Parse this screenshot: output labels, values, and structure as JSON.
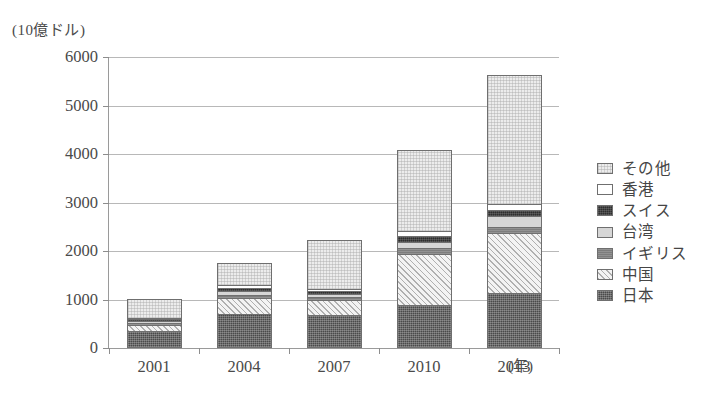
{
  "chart_data": {
    "type": "bar",
    "title": "",
    "ylabel": "(10億ドル)",
    "xlabel": "(年)",
    "ylim": [
      0,
      6000
    ],
    "yticks": [
      0,
      1000,
      2000,
      3000,
      4000,
      5000,
      6000
    ],
    "ytick_labels": [
      "0",
      "1000",
      "2000",
      "3000",
      "4000",
      "5000",
      "6000"
    ],
    "grid": true,
    "stacked": true,
    "legend_position": "right",
    "categories": [
      "2001",
      "2004",
      "2007",
      "2010",
      "2013"
    ],
    "series": [
      {
        "name": "日本",
        "key": "japan",
        "values": [
          360,
          700,
          680,
          880,
          1140
        ]
      },
      {
        "name": "中国",
        "key": "china",
        "values": [
          110,
          330,
          310,
          1060,
          1230
        ]
      },
      {
        "name": "イギリス",
        "key": "uk",
        "values": [
          40,
          70,
          60,
          130,
          130
        ]
      },
      {
        "name": "台湾",
        "key": "taiwan",
        "values": [
          40,
          70,
          60,
          110,
          220
        ]
      },
      {
        "name": "スイス",
        "key": "swiss",
        "values": [
          40,
          70,
          60,
          120,
          130
        ]
      },
      {
        "name": "香港",
        "key": "hk",
        "values": [
          30,
          60,
          50,
          110,
          120
        ]
      },
      {
        "name": "その他",
        "key": "other",
        "values": [
          400,
          460,
          1000,
          1670,
          2660
        ]
      }
    ],
    "totals": [
      1020,
      1760,
      2220,
      4080,
      5630
    ]
  },
  "legend": {
    "items": [
      {
        "label": "その他",
        "key": "other"
      },
      {
        "label": "香港",
        "key": "hk"
      },
      {
        "label": "スイス",
        "key": "swiss"
      },
      {
        "label": "台湾",
        "key": "taiwan"
      },
      {
        "label": "イギリス",
        "key": "uk"
      },
      {
        "label": "中国",
        "key": "china"
      },
      {
        "label": "日本",
        "key": "japan"
      }
    ]
  },
  "colors": {
    "japan": "#4a4a4a",
    "china": "#f3f3f3",
    "uk": "#7d7d7d",
    "taiwan": "#d6d6d6",
    "swiss": "#2e2e2e",
    "hk": "#ffffff",
    "other": "#ececec",
    "axis": "#8d8d8d",
    "grid": "#b8b8b8",
    "text": "#4a4a4a"
  }
}
